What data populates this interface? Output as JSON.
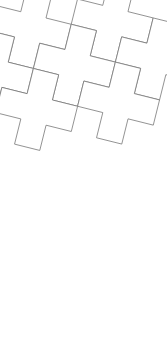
{
  "figure": {
    "width": 167,
    "height": 361,
    "background_color": "#ffffff"
  },
  "style": {
    "fill_color": "#ffffff",
    "stroke_color": "#777777",
    "stroke_width": 0.8
  },
  "chart_data": {
    "type": "diagram",
    "tile_shape": "greek-cross",
    "cell_size": 26,
    "rotation_degrees": 14,
    "lattice_vectors": [
      [
        2,
        1
      ],
      [
        -1,
        2
      ]
    ],
    "origin": [
      46,
      18
    ],
    "tile_count": 9,
    "tile_outline_cells": [
      [
        1,
        0
      ],
      [
        2,
        0
      ],
      [
        2,
        1
      ],
      [
        3,
        1
      ],
      [
        3,
        2
      ],
      [
        2,
        2
      ],
      [
        2,
        3
      ],
      [
        1,
        3
      ],
      [
        1,
        2
      ],
      [
        0,
        2
      ],
      [
        0,
        1
      ],
      [
        1,
        1
      ]
    ],
    "tiles": [
      {
        "id": "tile-1",
        "lattice": [
          0,
          -1
        ]
      },
      {
        "id": "tile-2",
        "lattice": [
          1,
          -1
        ]
      },
      {
        "id": "tile-3",
        "lattice": [
          -1,
          0
        ]
      },
      {
        "id": "tile-4",
        "lattice": [
          0,
          0
        ]
      },
      {
        "id": "tile-5",
        "lattice": [
          1,
          0
        ]
      },
      {
        "id": "tile-6",
        "lattice": [
          -1,
          1
        ]
      },
      {
        "id": "tile-7",
        "lattice": [
          0,
          1
        ]
      },
      {
        "id": "tile-8",
        "lattice": [
          -2,
          2
        ]
      },
      {
        "id": "tile-9",
        "lattice": [
          -1,
          2
        ]
      }
    ]
  }
}
